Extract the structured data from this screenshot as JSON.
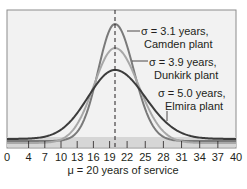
{
  "chart_data": {
    "type": "line",
    "title": "",
    "xlabel": "μ = 20 years of service",
    "ylabel": "",
    "xlim": [
      0,
      40
    ],
    "x_ticks": [
      0,
      4,
      7,
      10,
      13,
      16,
      19,
      22,
      25,
      28,
      31,
      34,
      37,
      40
    ],
    "mean": 20,
    "mean_line": "dashed vertical",
    "grid": false,
    "series": [
      {
        "name": "Camden plant",
        "sigma": 3.1,
        "mu": 20,
        "color": "#7a7a7a",
        "label_line1": "σ = 3.1 years,",
        "label_line2": "Camden plant"
      },
      {
        "name": "Dunkirk plant",
        "sigma": 3.9,
        "mu": 20,
        "color": "#a8a8a8",
        "label_line1": "σ = 3.9 years,",
        "label_line2": "Dunkirk plant"
      },
      {
        "name": "Elmira plant",
        "sigma": 5.0,
        "mu": 20,
        "color": "#3c3c3c",
        "label_line1": "σ = 5.0 years,",
        "label_line2": "Elmira plant"
      }
    ]
  },
  "colors": {
    "plot_bg": "#f2f2f2",
    "border": "#8c8c8c",
    "text": "#231f20"
  }
}
